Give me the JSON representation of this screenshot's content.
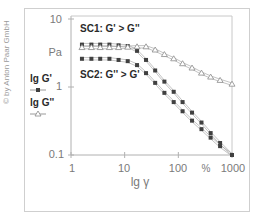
{
  "copyright": "© by Anton Paar GmbH",
  "legend": {
    "g_prime": "lg G'",
    "g_double_prime": "lg G''"
  },
  "annotations": {
    "sc1": "SC1: G' > G''",
    "sc2": "SC2: G'' > G'"
  },
  "axes": {
    "y_unit": "Pa",
    "x_unit": "%",
    "x_label": "lg γ",
    "y_ticks": [
      "10",
      "1",
      "0.1"
    ],
    "x_ticks": [
      "1",
      "10",
      "100",
      "1000"
    ]
  },
  "colors": {
    "filled_marker": "#404040",
    "open_marker": "#8a8a8a",
    "line": "#9a9a9a",
    "axis": "#b0b0b0",
    "text": "#7a7a7a",
    "annotation": "#2a2a2a"
  },
  "chart_data": {
    "type": "line",
    "title": "",
    "xlabel": "lg γ (%)",
    "ylabel": "Pa",
    "xscale": "log",
    "yscale": "log",
    "xlim": [
      1,
      1000
    ],
    "ylim": [
      0.1,
      10
    ],
    "grid": false,
    "legend_position": "left-outside",
    "annotations": [
      "SC1: G' > G''",
      "SC2: G'' > G'"
    ],
    "x": [
      1.6,
      2.4,
      3.5,
      5.2,
      7.7,
      11.4,
      17,
      25,
      37,
      55,
      82,
      120,
      180,
      270,
      400,
      600,
      1000
    ],
    "series": [
      {
        "name": "G' (SC1)",
        "marker": "filled-square",
        "values": [
          4.2,
          4.2,
          4.2,
          4.2,
          4.1,
          4.0,
          3.4,
          2.5,
          1.75,
          1.2,
          0.85,
          0.6,
          0.42,
          0.3,
          0.21,
          0.15,
          0.1
        ]
      },
      {
        "name": "G'' ",
        "marker": "open-triangle",
        "values": [
          3.8,
          3.8,
          3.8,
          3.8,
          3.8,
          3.85,
          3.9,
          3.9,
          3.5,
          3.0,
          2.6,
          2.2,
          1.9,
          1.6,
          1.4,
          1.25,
          1.1
        ]
      },
      {
        "name": "G' (SC2)",
        "marker": "filled-square",
        "values": [
          2.6,
          2.6,
          2.6,
          2.6,
          2.5,
          2.4,
          2.1,
          1.6,
          1.15,
          0.82,
          0.6,
          0.44,
          0.32,
          0.24,
          0.18,
          0.135,
          0.1
        ]
      }
    ]
  }
}
